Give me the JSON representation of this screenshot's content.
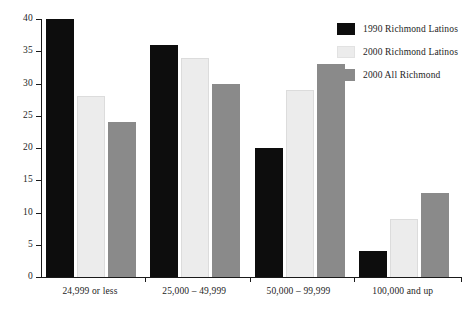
{
  "chart_data": {
    "type": "bar",
    "title": "",
    "subtitle": "",
    "xlabel": "",
    "ylabel": "",
    "ylim": [
      0,
      40
    ],
    "yticks": [
      0,
      5,
      10,
      15,
      20,
      25,
      30,
      35,
      40
    ],
    "ytick_labels": [
      "0",
      "5",
      "10",
      "15",
      "20",
      "25",
      "30",
      "35",
      "40"
    ],
    "grid": false,
    "legend_position": "top-right",
    "categories": [
      "24,999 or less",
      "25,000 – 49,999",
      "50,000 – 99,999",
      "100,000 and up"
    ],
    "series": [
      {
        "name": "1990 Richmond Latinos",
        "color": "#0d0d0d",
        "values": [
          40,
          36,
          20,
          4
        ]
      },
      {
        "name": "2000 Richmond Latinos",
        "color": "#ececec",
        "values": [
          28,
          34,
          29,
          9
        ]
      },
      {
        "name": "2000 All Richmond",
        "color": "#8a8a8a",
        "values": [
          24,
          30,
          33,
          13
        ]
      }
    ]
  }
}
